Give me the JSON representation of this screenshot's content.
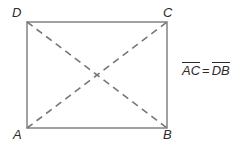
{
  "figure": {
    "type": "geometry-diagram",
    "shape": "rectangle",
    "background_color": "#ffffff",
    "stroke_color": "#8a8a8a",
    "label_color": "#2b2b2b",
    "vertices": {
      "D": {
        "label": "D",
        "position": "top-left"
      },
      "C": {
        "label": "C",
        "position": "top-right"
      },
      "A": {
        "label": "A",
        "position": "bottom-left"
      },
      "B": {
        "label": "B",
        "position": "bottom-right"
      }
    },
    "diagonals": {
      "style": "dashed",
      "segments": [
        "A-C",
        "D-B"
      ]
    },
    "equation": {
      "left_segment": "AC",
      "relation": "=",
      "right_segment": "DB",
      "full_text": "AC = DB"
    }
  }
}
